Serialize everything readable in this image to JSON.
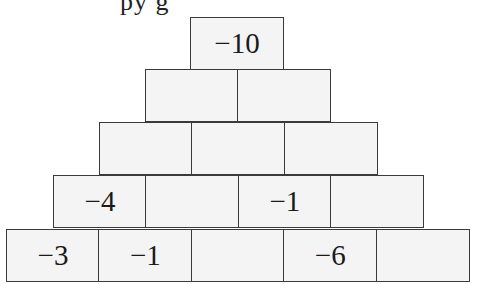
{
  "header": {
    "cropped_text": "py                g"
  },
  "pyramid": {
    "rows": [
      {
        "cells": [
          "−10"
        ]
      },
      {
        "cells": [
          "",
          ""
        ]
      },
      {
        "cells": [
          "",
          "",
          ""
        ]
      },
      {
        "cells": [
          "−4",
          "",
          "−1",
          ""
        ]
      },
      {
        "cells": [
          "−3",
          "−1",
          "",
          "−6",
          ""
        ]
      }
    ]
  },
  "colors": {
    "cell_fill": "#f4f4f4",
    "cell_border": "#3a3a3a",
    "text": "#1a1a1a"
  }
}
